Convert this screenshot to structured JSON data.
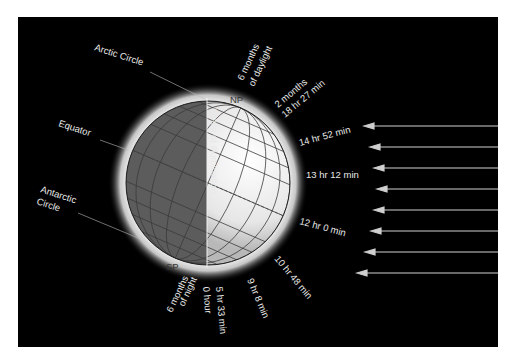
{
  "diagram": {
    "background_color": "#000000",
    "labels": {
      "arctic_circle": "Arctic Circle",
      "equator": "Equator",
      "antarctic_circle_1": "Antarctic",
      "antarctic_circle_2": "Circle",
      "circle_of_illumination": "Circle of Illumination",
      "north_pole": "NP",
      "south_pole": "SP"
    },
    "daylight_north": {
      "pole_1": "6 months",
      "pole_2": "of daylight",
      "arctic_1": "2 months",
      "arctic_2": "18 hr 27 min",
      "lat_a": "14 hr 52 min",
      "lat_b": "13 hr 12 min",
      "equator": "12 hr 0 min"
    },
    "daylight_south": {
      "lat_c": "10 hr 48 min",
      "lat_d": "9 hr 8 min",
      "antarctic_1": "5 hr 33 min",
      "antarctic_2": "0 hour",
      "pole_1": "6 months",
      "pole_2": "of night"
    },
    "sun_rays": {
      "count": 8,
      "direction": "leftward",
      "color": "#cfcfcf"
    }
  }
}
